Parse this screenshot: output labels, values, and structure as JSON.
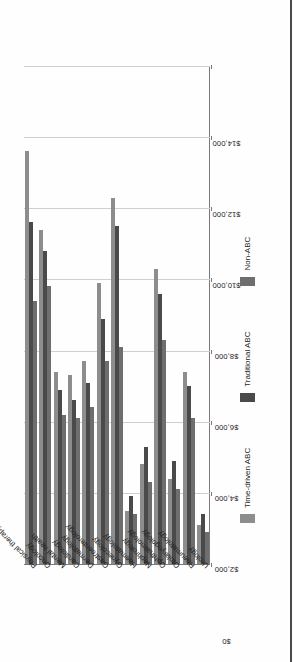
{
  "chart_data": {
    "type": "bar",
    "orientation": "horizontal-rotated",
    "title": "",
    "subtitle": "",
    "xlabel": "",
    "ylabel": "",
    "grid": true,
    "legend_position": "bottom",
    "value_axis": {
      "min": 0,
      "max": 14000,
      "step": 2000,
      "tick_labels": [
        "$0",
        "$2,000",
        "$4,000",
        "$6,000",
        "$8,000",
        "$10,000",
        "$12,000",
        "$14,000"
      ],
      "tick_values": [
        0,
        2000,
        4000,
        6000,
        8000,
        10000,
        12000,
        14000
      ]
    },
    "categories": [
      "Physical therapy",
      "Oncology",
      "Mental health",
      "Cardiology",
      "Dermatology",
      "Gastroenterology",
      "Gynecology",
      "Haematology",
      "Nephrology",
      "Ophthalmology",
      "Otolaryngology",
      "Rheumatology",
      "Urology"
    ],
    "series": [
      {
        "name": "Time-driven ABC",
        "color": "#8d8d8d",
        "values": [
          11600,
          9400,
          5400,
          5300,
          5700,
          7900,
          10300,
          1500,
          2800,
          8300,
          2400,
          5400,
          1100
        ]
      },
      {
        "name": "Traditional ABC",
        "color": "#4a4a4a",
        "values": [
          9600,
          8800,
          4900,
          4600,
          5100,
          6900,
          9500,
          1900,
          3300,
          7600,
          2900,
          5000,
          1400
        ]
      },
      {
        "name": "Non-ABC",
        "color": "#6e6e6e",
        "values": [
          7400,
          7800,
          4200,
          4100,
          4400,
          5700,
          6100,
          1400,
          2300,
          6300,
          2100,
          4100,
          900
        ]
      }
    ]
  },
  "legend": {
    "items": [
      {
        "label": "Time-driven ABC",
        "color": "#8d8d8d"
      },
      {
        "label": "Traditional ABC",
        "color": "#4a4a4a"
      },
      {
        "label": "Non-ABC",
        "color": "#6e6e6e"
      }
    ]
  }
}
